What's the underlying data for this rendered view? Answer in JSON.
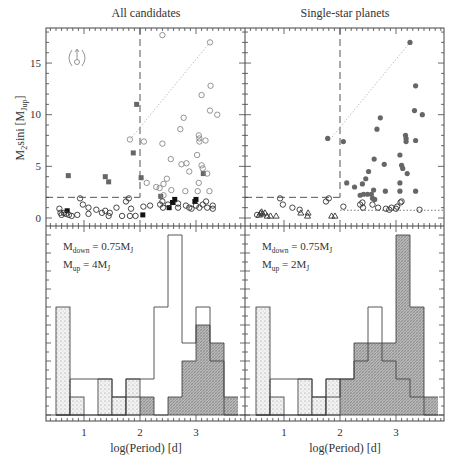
{
  "figure": {
    "panel_titles": [
      "All candidates",
      "Single-star planets"
    ],
    "ylabel_top": "M2sini [MJup]",
    "ylabel_top_parts": {
      "base": "M",
      "sub1": "2",
      "mid": "sini [M",
      "sub2": "Jup",
      "end": "]"
    },
    "xlabel": "log(Period) [d]",
    "x_ticks": [
      "1",
      "2",
      "3"
    ],
    "y_ticks_top": [
      "0",
      "5",
      "10",
      "15"
    ],
    "annotations": [
      {
        "line1_base": "M",
        "line1_sub": "down",
        "line1_rest": " = 0.75M",
        "line1_sub2": "J",
        "line2_base": "M",
        "line2_sub": "up",
        "line2_rest": " = 4M",
        "line2_sub2": "J"
      },
      {
        "line1_base": "M",
        "line1_sub": "down",
        "line1_rest": " = 0.75M",
        "line1_sub2": "J",
        "line2_base": "M",
        "line2_sub": "up",
        "line2_rest": " = 2M",
        "line2_sub2": "J"
      }
    ]
  },
  "chart_data": [
    {
      "type": "scatter",
      "title": "All candidates",
      "xlabel": "log(Period) [d]",
      "ylabel": "M2sini [MJup]",
      "xlim": [
        0.3,
        3.85
      ],
      "ylim": [
        -0.3,
        18.5
      ],
      "thresholds": {
        "logP_dashed": 2.0,
        "mass_dashed": 2.0
      },
      "legend_symbol": "lower-limit (circle with up arrow in parentheses)",
      "series": [
        {
          "name": "filled squares (grey)",
          "points": [
            [
              0.72,
              4.1
            ],
            [
              1.38,
              4.0
            ],
            [
              1.44,
              3.5
            ],
            [
              1.94,
              11.0
            ],
            [
              1.88,
              6.3
            ],
            [
              2.02,
              3.9
            ],
            [
              2.37,
              2.1
            ],
            [
              3.13,
              4.3
            ]
          ]
        },
        {
          "name": "filled squares (black)",
          "points": [
            [
              0.7,
              0.7
            ],
            [
              2.05,
              0.3
            ],
            [
              2.52,
              1.0
            ],
            [
              2.62,
              1.8
            ],
            [
              2.58,
              1.5
            ],
            [
              2.98,
              1.6
            ],
            [
              3.0,
              1.8
            ]
          ]
        },
        {
          "name": "open circles",
          "points": [
            [
              2.4,
              17.7
            ],
            [
              3.25,
              17.0
            ],
            [
              3.26,
              12.8
            ],
            [
              3.1,
              11.9
            ],
            [
              3.25,
              10.4
            ],
            [
              3.38,
              10.0
            ],
            [
              2.78,
              9.7
            ],
            [
              2.72,
              8.6
            ],
            [
              1.82,
              7.6
            ],
            [
              2.07,
              7.4
            ],
            [
              2.4,
              7.2
            ],
            [
              3.05,
              8.0
            ],
            [
              3.06,
              7.7
            ],
            [
              3.06,
              7.4
            ],
            [
              3.17,
              7.5
            ],
            [
              2.55,
              5.7
            ],
            [
              2.74,
              5.2
            ],
            [
              2.83,
              5.3
            ],
            [
              3.1,
              5.1
            ],
            [
              3.12,
              4.8
            ],
            [
              3.2,
              4.3
            ],
            [
              2.88,
              4.5
            ],
            [
              3.02,
              6.1
            ],
            [
              2.12,
              3.4
            ],
            [
              2.29,
              3.0
            ],
            [
              2.35,
              2.9
            ],
            [
              2.42,
              3.3
            ],
            [
              2.48,
              3.8
            ],
            [
              2.56,
              2.7
            ],
            [
              2.81,
              2.6
            ],
            [
              3.03,
              2.6
            ],
            [
              3.24,
              2.6
            ],
            [
              3.05,
              3.4
            ],
            [
              2.42,
              2.2
            ],
            [
              2.4,
              1.6
            ],
            [
              2.36,
              1.3
            ],
            [
              2.5,
              1.3
            ],
            [
              2.68,
              1.4
            ],
            [
              2.82,
              1.2
            ],
            [
              2.88,
              1.0
            ],
            [
              3.0,
              1.2
            ],
            [
              3.06,
              1.0
            ],
            [
              3.12,
              1.3
            ],
            [
              3.18,
              1.6
            ],
            [
              3.3,
              1.2
            ],
            [
              3.3,
              0.9
            ],
            [
              2.06,
              1.1
            ],
            [
              2.18,
              1.2
            ],
            [
              2.41,
              1.0
            ],
            [
              2.68,
              1.0
            ],
            [
              2.92,
              0.9
            ],
            [
              3.2,
              1.0
            ],
            [
              0.56,
              0.9
            ],
            [
              0.58,
              0.5
            ],
            [
              0.6,
              0.3
            ],
            [
              0.64,
              0.5
            ],
            [
              0.68,
              0.4
            ],
            [
              0.73,
              0.3
            ],
            [
              0.78,
              0.2
            ],
            [
              0.88,
              0.3
            ],
            [
              0.98,
              1.3
            ],
            [
              0.93,
              1.9
            ],
            [
              1.08,
              0.4
            ],
            [
              1.08,
              1.0
            ],
            [
              1.22,
              0.8
            ],
            [
              1.32,
              0.5
            ],
            [
              1.38,
              0.7
            ],
            [
              1.46,
              0.5
            ],
            [
              1.44,
              0.2
            ],
            [
              1.58,
              1.0
            ],
            [
              1.68,
              0.2
            ],
            [
              1.75,
              1.6
            ],
            [
              1.8,
              1.9
            ],
            [
              1.82,
              0.2
            ],
            [
              1.84,
              0.9
            ],
            [
              1.92,
              0.2
            ]
          ]
        }
      ]
    },
    {
      "type": "scatter",
      "title": "Single-star planets",
      "xlabel": "log(Period) [d]",
      "xlim": [
        0.3,
        3.85
      ],
      "ylim": [
        -0.3,
        18.5
      ],
      "thresholds": {
        "logP_dashed": 2.0,
        "mass_dashed": 2.0,
        "mass_dotted_right": 0.75
      },
      "series": [
        {
          "name": "filled circles (grey)",
          "points": [
            [
              1.78,
              7.7
            ],
            [
              2.06,
              7.4
            ],
            [
              3.25,
              17.0
            ],
            [
              3.35,
              12.8
            ],
            [
              3.33,
              10.4
            ],
            [
              3.47,
              10.0
            ],
            [
              2.72,
              9.7
            ],
            [
              2.66,
              8.6
            ],
            [
              3.17,
              8.0
            ],
            [
              3.18,
              7.7
            ],
            [
              3.18,
              7.4
            ],
            [
              3.35,
              7.5
            ],
            [
              2.61,
              5.7
            ],
            [
              2.79,
              5.2
            ],
            [
              3.07,
              6.1
            ],
            [
              3.1,
              5.1
            ],
            [
              3.12,
              4.8
            ],
            [
              3.2,
              4.3
            ],
            [
              2.51,
              4.5
            ],
            [
              2.12,
              3.4
            ],
            [
              2.26,
              3.0
            ],
            [
              2.4,
              3.3
            ],
            [
              2.46,
              3.8
            ],
            [
              2.6,
              2.7
            ],
            [
              2.81,
              2.6
            ],
            [
              3.07,
              3.4
            ],
            [
              3.07,
              2.6
            ],
            [
              3.35,
              2.6
            ],
            [
              2.36,
              2.2
            ],
            [
              2.42,
              2.3
            ],
            [
              2.49,
              2.3
            ],
            [
              2.56,
              2.3
            ],
            [
              2.58,
              1.9
            ],
            [
              2.62,
              1.8
            ]
          ]
        },
        {
          "name": "open circles",
          "points": [
            [
              0.93,
              1.9
            ],
            [
              0.98,
              1.3
            ],
            [
              1.15,
              1.0
            ],
            [
              1.28,
              0.8
            ],
            [
              1.75,
              1.6
            ],
            [
              1.8,
              1.9
            ],
            [
              2.06,
              1.1
            ],
            [
              2.36,
              1.3
            ],
            [
              2.4,
              1.5
            ],
            [
              2.41,
              1.0
            ],
            [
              2.58,
              1.3
            ],
            [
              2.68,
              1.0
            ],
            [
              2.82,
              0.9
            ],
            [
              2.88,
              0.8
            ],
            [
              2.92,
              1.0
            ],
            [
              3.0,
              0.9
            ],
            [
              3.02,
              1.1
            ],
            [
              3.08,
              1.5
            ],
            [
              3.1,
              1.6
            ],
            [
              3.42,
              0.8
            ],
            [
              0.52,
              0.3
            ]
          ]
        },
        {
          "name": "open triangles",
          "points": [
            [
              0.56,
              0.3
            ],
            [
              0.58,
              0.5
            ],
            [
              0.6,
              0.6
            ],
            [
              0.62,
              0.4
            ],
            [
              0.66,
              0.5
            ],
            [
              0.7,
              0.2
            ],
            [
              0.76,
              0.2
            ],
            [
              0.86,
              0.2
            ],
            [
              1.3,
              0.5
            ],
            [
              1.43,
              0.5
            ],
            [
              1.42,
              0.2
            ],
            [
              1.85,
              0.2
            ],
            [
              1.91,
              0.2
            ]
          ]
        }
      ]
    },
    {
      "type": "bar",
      "title": "All candidates histogram",
      "xlabel": "log(Period) [d]",
      "annotation": "Mdown = 0.75MJ, Mup = 4MJ",
      "bin_edges": [
        0.5,
        0.75,
        1.0,
        1.25,
        1.5,
        1.75,
        2.0,
        2.25,
        2.5,
        2.75,
        3.0,
        3.25,
        3.5,
        3.75
      ],
      "series": [
        {
          "name": "all (open)",
          "values": [
            0,
            2,
            2,
            2,
            1,
            2,
            2,
            6,
            10,
            4,
            6,
            3,
            0
          ]
        },
        {
          "name": "M < Mdown (dotted)",
          "values": [
            6,
            1,
            0,
            2,
            1,
            2,
            0,
            0,
            0,
            0,
            0,
            0,
            0
          ]
        },
        {
          "name": "M > Mup (hatched)",
          "values": [
            0,
            0,
            0,
            0,
            0,
            1,
            1,
            0,
            1,
            3,
            5,
            4,
            1
          ]
        }
      ]
    },
    {
      "type": "bar",
      "title": "Single-star planets histogram",
      "xlabel": "log(Period) [d]",
      "annotation": "Mdown = 0.75MJ, Mup = 2MJ",
      "bin_edges": [
        0.5,
        0.75,
        1.0,
        1.25,
        1.5,
        1.75,
        2.0,
        2.25,
        2.5,
        2.75,
        3.0,
        3.25,
        3.5,
        3.75
      ],
      "series": [
        {
          "name": "all (open)",
          "values": [
            0,
            2,
            2,
            2,
            1,
            2,
            2,
            3,
            6,
            3,
            2,
            1,
            0
          ]
        },
        {
          "name": "M < Mdown (dotted)",
          "values": [
            6,
            1,
            0,
            2,
            1,
            2,
            0,
            0,
            0,
            0,
            0,
            0,
            0
          ]
        },
        {
          "name": "M > Mup (hatched)",
          "values": [
            0,
            0,
            0,
            0,
            0,
            1,
            2,
            4,
            4,
            4,
            10,
            6,
            1
          ]
        }
      ]
    }
  ]
}
